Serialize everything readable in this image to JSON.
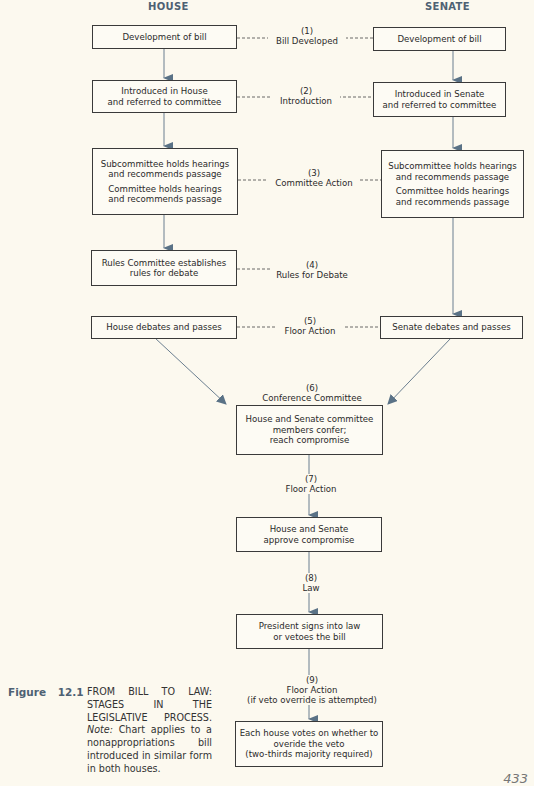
{
  "headers": {
    "house": "HOUSE",
    "senate": "SENATE"
  },
  "house_boxes": {
    "b1": "Development of bill",
    "b2": "Introduced in House\nand referred to committee",
    "b3a": "Subcommittee holds hearings\nand recommends passage",
    "b3b": "Committee holds hearings\nand recommends passage",
    "b4": "Rules Committee establishes\nrules for debate",
    "b5": "House debates and passes"
  },
  "senate_boxes": {
    "b1": "Development of bill",
    "b2": "Introduced in Senate\nand referred to committee",
    "b3a": "Subcommittee holds hearings\nand recommends passage",
    "b3b": "Committee holds hearings\nand recommends passage",
    "b5": "Senate debates and passes"
  },
  "joint_boxes": {
    "conference": "House and Senate committee\nmembers confer;\nreach compromise",
    "approve": "House and Senate\napprove compromise",
    "president": "President signs into law\nor vetoes the bill",
    "override": "Each house votes on whether to\noveride the veto\n(two-thirds majority required)"
  },
  "stages": {
    "s1": "(1)\nBill Developed",
    "s2": "(2)\nIntroduction",
    "s3": "(3)\nCommittee Action",
    "s4": "(4)\nRules for Debate",
    "s5": "(5)\nFloor Action",
    "s6": "(6)\nConference Committee",
    "s7": "(7)\nFloor Action",
    "s8": "(8)\nLaw",
    "s9": "(9)\nFloor Action\n(if veto override is attempted)"
  },
  "caption": {
    "label": "Figure 12.1",
    "title": "FROM BILL TO LAW: STAGES IN THE LEGISLATIVE PROCESS.",
    "note_label": "Note:",
    "note": "Chart applies to a nonappropriations bill introduced in similar form in both houses."
  },
  "page_number": "433",
  "colors": {
    "accent": "#4e6173",
    "arrow": "#5a7286",
    "background": "#fcf9ef"
  }
}
